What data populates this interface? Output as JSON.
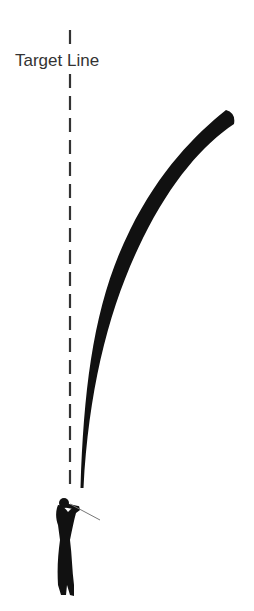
{
  "diagram": {
    "target_line_label": "Target Line",
    "elements": [
      "target-line (dashed vertical)",
      "ball-flight curve (draw/hook to right)",
      "golfer silhouette"
    ],
    "colors": {
      "line": "#222222",
      "text": "#333333",
      "background": "#ffffff"
    }
  }
}
